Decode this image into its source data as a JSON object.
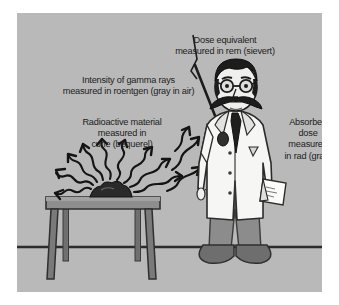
{
  "illustration": {
    "subject": "radiation-units-diagram",
    "panel_background_color": "#b9b9b9",
    "border_color": "#ffffff",
    "text_color": "#1c1c1c"
  },
  "captions": {
    "dose_equivalent": "Dose equivalent\nmeasured in rem (sievert)",
    "gamma_intensity": "Intensity of gamma rays\nmeasured in roentgen (gray in air)",
    "radioactive_material": "Radioactive material\nmeasured in\ncurie (bequerel)",
    "absorbed_dose": "Absorbed\ndose\nmeasured\nin rad (gray)"
  },
  "scene": {
    "figure": {
      "name": "scientist",
      "lab_coat_color": "#f4f4f2",
      "trousers_color": "#8c8c8c",
      "hair_color": "#1c1c1c",
      "shoe_color": "#6a6a6a"
    },
    "table": {
      "name": "laboratory-table",
      "top_color": "#8e8e8e",
      "leg_color": "#7a7a7a"
    },
    "sample": {
      "name": "radioactive-sample",
      "color": "#2a2a2a"
    },
    "floor_line_color": "#2b2b2b"
  }
}
